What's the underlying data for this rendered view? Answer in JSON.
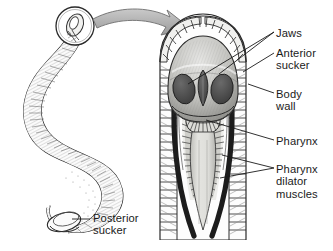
{
  "figure": {
    "background_color": "#ffffff",
    "ink_color": "#1a1a1a",
    "arrow_color": "#a8a8a8",
    "jaw_color": "#4a4a4a",
    "body_wall_color": "#2b2b2b",
    "pharynx_color": "#d8d8d4"
  },
  "labels": {
    "jaws": "Jaws",
    "anterior_sucker": "Anterior\nsucker",
    "body_wall": "Body\nwall",
    "pharynx": "Pharynx",
    "pharynx_dilator_muscles": "Pharynx\ndilator\nmuscles",
    "posterior_sucker": "Posterior\nsucker"
  },
  "parts": {
    "whole_leech": "whole-leech-body",
    "magnifier_circle": "anterior-sucker-magnifier",
    "transition_arrow": "magnification-arrow",
    "cross_section": "anterior-dissection-cross-section"
  }
}
